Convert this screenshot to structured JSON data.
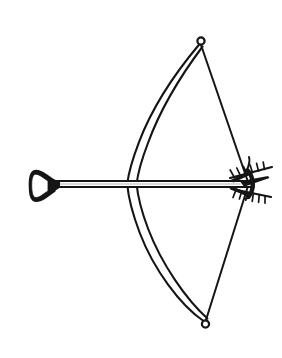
{
  "meta": {
    "title": "Bow and Arrow",
    "style": "black ink outline drawing on white background",
    "width": 282,
    "height": 358
  },
  "colors": {
    "background": "#ffffff",
    "ink": "#151515",
    "ink_light": "#2a2a2a",
    "paper_fill": "#ffffff"
  },
  "parts": [
    {
      "id": "bow-upper-limb",
      "label": "Upper bow limb",
      "description": "Curved wooden limb sweeping from the grip up and to the right toward the upper nock ring"
    },
    {
      "id": "bow-lower-limb",
      "label": "Lower bow limb",
      "description": "Curved wooden limb sweeping from the grip down and to the right toward the lower nock ring"
    },
    {
      "id": "bow-string-upper",
      "label": "Upper bowstring",
      "description": "Straight string segment from the upper nock ring down to the nocking point"
    },
    {
      "id": "bow-string-lower",
      "label": "Lower bowstring",
      "description": "Straight string segment from the nocking point down to the lower nock ring"
    },
    {
      "id": "nock-ring-top",
      "label": "Upper string nock ring",
      "description": "Small open circle at the tip of the upper limb"
    },
    {
      "id": "nock-ring-bottom",
      "label": "Lower string nock ring",
      "description": "Small open circle at the tip of the lower limb"
    },
    {
      "id": "arrow-shaft",
      "label": "Arrow shaft",
      "description": "Long horizontal twin-line shaft crossing the bow from left to right"
    },
    {
      "id": "arrow-head",
      "label": "Arrow head",
      "description": "Hollow bell shaped blunt tip at the left end of the shaft"
    },
    {
      "id": "arrow-fletching",
      "label": "Arrow fletching",
      "description": "Barbed feather vanes at the right end of the shaft where the string is nocked"
    }
  ],
  "geometry": {
    "upper_tip": {
      "x": 200,
      "y": 41
    },
    "lower_tip": {
      "x": 205,
      "y": 324
    },
    "nocking_point": {
      "x": 247,
      "y": 183
    },
    "shaft_y": 184,
    "shaft_left_x": 55,
    "shaft_right_x": 262,
    "grip_x": 138,
    "limb_max_bulge_x": 126,
    "head_center": {
      "x": 42,
      "y": 186
    }
  },
  "labels": {
    "figure_caption": "Bow and arrow"
  }
}
